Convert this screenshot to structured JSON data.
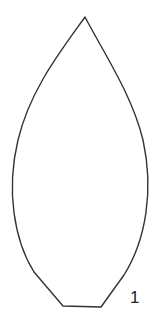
{
  "figure": {
    "shape": "leaf-outline",
    "stroke_color": "#333333",
    "background": "#ffffff",
    "label": "1"
  }
}
